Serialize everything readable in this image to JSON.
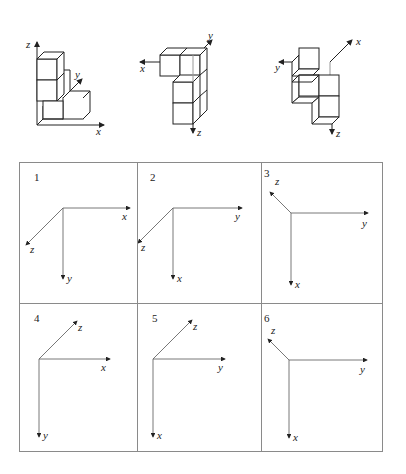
{
  "figures": [
    {
      "id": "view-a",
      "axes": [
        "x",
        "y",
        "z"
      ]
    },
    {
      "id": "view-b",
      "axes": [
        "x",
        "y",
        "z"
      ]
    },
    {
      "id": "view-c",
      "axes": [
        "x",
        "y",
        "z"
      ]
    }
  ],
  "options": [
    {
      "number": "1",
      "axes": {
        "right": "x",
        "down": "y",
        "diagonal": "z",
        "diagonal_dir": "down-left"
      }
    },
    {
      "number": "2",
      "axes": {
        "right": "y",
        "down": "x",
        "diagonal": "z",
        "diagonal_dir": "down-left"
      }
    },
    {
      "number": "3",
      "axes": {
        "right": "y",
        "down": "x",
        "diagonal": "z",
        "diagonal_dir": "up-left"
      }
    },
    {
      "number": "4",
      "axes": {
        "right": "x",
        "down": "y",
        "diagonal": "z",
        "diagonal_dir": "up-right"
      }
    },
    {
      "number": "5",
      "axes": {
        "right": "y",
        "down": "x",
        "diagonal": "z",
        "diagonal_dir": "up-right"
      }
    },
    {
      "number": "6",
      "axes": {
        "right": "y",
        "down": "x",
        "diagonal": "z",
        "diagonal_dir": "up-left"
      }
    }
  ],
  "labels": {
    "x": "x",
    "y": "y",
    "z": "z"
  }
}
